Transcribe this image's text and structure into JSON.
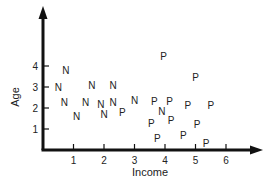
{
  "chart_data": {
    "type": "scatter",
    "title": "",
    "xlabel": "Income",
    "ylabel": "Age",
    "x_ticks": [
      "1",
      "2",
      "3",
      "4",
      "5",
      "6"
    ],
    "y_ticks": [
      "1",
      "2",
      "3",
      "4"
    ],
    "xlim": [
      0,
      7.2
    ],
    "ylim": [
      0,
      6.7
    ],
    "grid": false,
    "legend": null,
    "marker_style": "letter",
    "series": [
      {
        "name": "N",
        "points": [
          {
            "x": 0.75,
            "y": 3.8
          },
          {
            "x": 0.5,
            "y": 3.0
          },
          {
            "x": 0.7,
            "y": 2.3
          },
          {
            "x": 1.1,
            "y": 1.6
          },
          {
            "x": 1.6,
            "y": 3.1
          },
          {
            "x": 1.4,
            "y": 2.3
          },
          {
            "x": 2.3,
            "y": 3.1
          },
          {
            "x": 1.9,
            "y": 2.2
          },
          {
            "x": 2.3,
            "y": 2.3
          },
          {
            "x": 2.0,
            "y": 1.7
          },
          {
            "x": 3.0,
            "y": 2.4
          },
          {
            "x": 3.9,
            "y": 1.85
          }
        ]
      },
      {
        "name": "P",
        "points": [
          {
            "x": 2.6,
            "y": 1.8
          },
          {
            "x": 3.95,
            "y": 4.5
          },
          {
            "x": 5.0,
            "y": 3.5
          },
          {
            "x": 3.65,
            "y": 2.35
          },
          {
            "x": 4.15,
            "y": 2.35
          },
          {
            "x": 4.75,
            "y": 2.15
          },
          {
            "x": 5.5,
            "y": 2.15
          },
          {
            "x": 3.55,
            "y": 1.3
          },
          {
            "x": 4.2,
            "y": 1.45
          },
          {
            "x": 5.05,
            "y": 1.25
          },
          {
            "x": 3.75,
            "y": 0.55
          },
          {
            "x": 4.6,
            "y": 0.7
          },
          {
            "x": 5.35,
            "y": 0.35
          }
        ]
      }
    ]
  }
}
